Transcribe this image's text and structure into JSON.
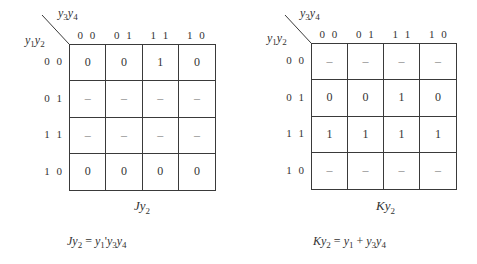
{
  "maps": [
    {
      "id": "Jy2",
      "col_var": {
        "a": "y",
        "a_sub": "3",
        "b": "y",
        "b_sub": "4"
      },
      "row_var": {
        "a": "y",
        "a_sub": "1",
        "b": "y",
        "b_sub": "2"
      },
      "col_headers": [
        "0 0",
        "0 1",
        "1 1",
        "1 0"
      ],
      "row_headers": [
        "0 0",
        "0 1",
        "1 1",
        "1 0"
      ],
      "cells": [
        [
          "0",
          "0",
          "1",
          "0"
        ],
        [
          "–",
          "–",
          "–",
          "–"
        ],
        [
          "–",
          "–",
          "–",
          "–"
        ],
        [
          "0",
          "0",
          "0",
          "0"
        ]
      ],
      "caption": {
        "main": "Jy",
        "sub": "2"
      },
      "formula": {
        "lhs": "Jy",
        "lhs_sub": "2",
        "eq": " = ",
        "terms": "y₁′y₃y₄",
        "rhs_parts": [
          {
            "t": "y",
            "s": "1"
          },
          {
            "t": "'",
            "s": ""
          },
          {
            "t": "y",
            "s": "3"
          },
          {
            "t": "y",
            "s": "4"
          }
        ]
      }
    },
    {
      "id": "Ky2",
      "col_var": {
        "a": "y",
        "a_sub": "3",
        "b": "y",
        "b_sub": "4"
      },
      "row_var": {
        "a": "y",
        "a_sub": "1",
        "b": "y",
        "b_sub": "2"
      },
      "col_headers": [
        "0 0",
        "0 1",
        "1 1",
        "1 0"
      ],
      "row_headers": [
        "0 0",
        "0 1",
        "1 1",
        "1 0"
      ],
      "cells": [
        [
          "–",
          "–",
          "–",
          "–"
        ],
        [
          "0",
          "0",
          "1",
          "0"
        ],
        [
          "1",
          "1",
          "1",
          "1"
        ],
        [
          "–",
          "–",
          "–",
          "–"
        ]
      ],
      "caption": {
        "main": "Ky",
        "sub": "2"
      },
      "formula": {
        "lhs": "Ky",
        "lhs_sub": "2",
        "eq": " = ",
        "terms": "y₁ + y₃y₄",
        "rhs_parts": [
          {
            "t": "y",
            "s": "1"
          },
          {
            "t": " + ",
            "s": ""
          },
          {
            "t": "y",
            "s": "3"
          },
          {
            "t": "y",
            "s": "4"
          }
        ]
      }
    }
  ]
}
